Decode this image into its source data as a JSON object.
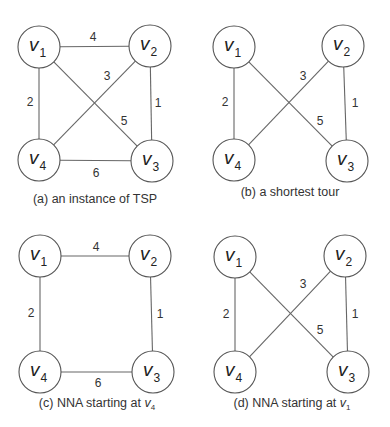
{
  "figure": {
    "node_radius": 21,
    "stroke_color": "#666666",
    "text_color": "#222222",
    "panels": [
      {
        "id": "a",
        "caption": {
          "prefix": "(a) an instance of TSP",
          "var": "",
          "sub": "",
          "x": 95,
          "y": 203
        },
        "nodes": [
          {
            "id": "v1",
            "base": "v",
            "sub": "1",
            "cx": 39,
            "cy": 47
          },
          {
            "id": "v2",
            "base": "v",
            "sub": "2",
            "cx": 150,
            "cy": 46
          },
          {
            "id": "v3",
            "base": "v",
            "sub": "3",
            "cx": 152,
            "cy": 161
          },
          {
            "id": "v4",
            "base": "v",
            "sub": "4",
            "cx": 39,
            "cy": 160
          }
        ],
        "edges": [
          {
            "from": "v1",
            "to": "v2",
            "weight": "4",
            "lx": 93,
            "ly": 41
          },
          {
            "from": "v2",
            "to": "v3",
            "weight": "1",
            "lx": 158,
            "ly": 107
          },
          {
            "from": "v3",
            "to": "v4",
            "weight": "6",
            "lx": 96,
            "ly": 177
          },
          {
            "from": "v4",
            "to": "v1",
            "weight": "2",
            "lx": 30,
            "ly": 106
          },
          {
            "from": "v2",
            "to": "v4",
            "weight": "3",
            "lx": 107,
            "ly": 80
          },
          {
            "from": "v1",
            "to": "v3",
            "weight": "5",
            "lx": 124,
            "ly": 125
          }
        ]
      },
      {
        "id": "b",
        "caption": {
          "prefix": "(b) a shortest tour",
          "var": "",
          "sub": "",
          "x": 290,
          "y": 196
        },
        "nodes": [
          {
            "id": "v1",
            "base": "v",
            "sub": "1",
            "cx": 234,
            "cy": 47
          },
          {
            "id": "v2",
            "base": "v",
            "sub": "2",
            "cx": 343,
            "cy": 46
          },
          {
            "id": "v3",
            "base": "v",
            "sub": "3",
            "cx": 347,
            "cy": 161
          },
          {
            "id": "v4",
            "base": "v",
            "sub": "4",
            "cx": 234,
            "cy": 160
          }
        ],
        "edges": [
          {
            "from": "v2",
            "to": "v3",
            "weight": "1",
            "lx": 355,
            "ly": 107
          },
          {
            "from": "v4",
            "to": "v1",
            "weight": "2",
            "lx": 225,
            "ly": 106
          },
          {
            "from": "v2",
            "to": "v4",
            "weight": "3",
            "lx": 303,
            "ly": 80
          },
          {
            "from": "v1",
            "to": "v3",
            "weight": "5",
            "lx": 320,
            "ly": 125
          }
        ]
      },
      {
        "id": "c",
        "caption": {
          "prefix": "(c) NNA starting at ",
          "var": "v",
          "sub": "4",
          "x": 97,
          "y": 407
        },
        "nodes": [
          {
            "id": "v1",
            "base": "v",
            "sub": "1",
            "cx": 40,
            "cy": 256
          },
          {
            "id": "v2",
            "base": "v",
            "sub": "2",
            "cx": 150,
            "cy": 256
          },
          {
            "id": "v3",
            "base": "v",
            "sub": "3",
            "cx": 153,
            "cy": 372
          },
          {
            "id": "v4",
            "base": "v",
            "sub": "4",
            "cx": 40,
            "cy": 372
          }
        ],
        "edges": [
          {
            "from": "v1",
            "to": "v2",
            "weight": "4",
            "lx": 96,
            "ly": 251
          },
          {
            "from": "v2",
            "to": "v3",
            "weight": "1",
            "lx": 160,
            "ly": 318
          },
          {
            "from": "v3",
            "to": "v4",
            "weight": "6",
            "lx": 98,
            "ly": 387
          },
          {
            "from": "v4",
            "to": "v1",
            "weight": "2",
            "lx": 31,
            "ly": 317
          }
        ]
      },
      {
        "id": "d",
        "caption": {
          "prefix": "(d) NNA starting at ",
          "var": "v",
          "sub": "1",
          "x": 292,
          "y": 407
        },
        "nodes": [
          {
            "id": "v1",
            "base": "v",
            "sub": "1",
            "cx": 235,
            "cy": 257
          },
          {
            "id": "v2",
            "base": "v",
            "sub": "2",
            "cx": 345,
            "cy": 256
          },
          {
            "id": "v3",
            "base": "v",
            "sub": "3",
            "cx": 348,
            "cy": 372
          },
          {
            "id": "v4",
            "base": "v",
            "sub": "4",
            "cx": 235,
            "cy": 372
          }
        ],
        "edges": [
          {
            "from": "v2",
            "to": "v3",
            "weight": "1",
            "lx": 355,
            "ly": 318
          },
          {
            "from": "v4",
            "to": "v1",
            "weight": "2",
            "lx": 226,
            "ly": 318
          },
          {
            "from": "v2",
            "to": "v4",
            "weight": "3",
            "lx": 303,
            "ly": 288
          },
          {
            "from": "v1",
            "to": "v3",
            "weight": "5",
            "lx": 320,
            "ly": 334
          }
        ]
      }
    ]
  }
}
